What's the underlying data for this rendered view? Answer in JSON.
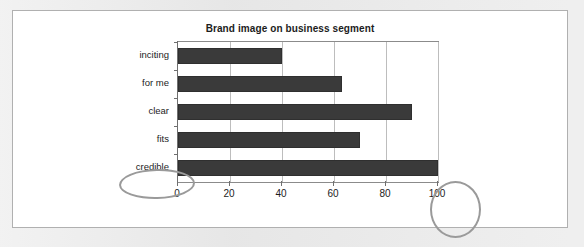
{
  "figure": {
    "title": "Brand image on business segment"
  },
  "chart_data": {
    "type": "bar",
    "orientation": "horizontal",
    "title": "Brand image on business segment",
    "xlabel": "",
    "ylabel": "",
    "categories": [
      "inciting",
      "for me",
      "clear",
      "fits",
      "credible"
    ],
    "values": [
      40,
      63,
      90,
      70,
      100
    ],
    "xlim": [
      0,
      100
    ],
    "xticks": [
      0,
      20,
      40,
      60,
      80,
      100
    ],
    "xtick_labels": [
      "0",
      "20",
      "40",
      "60",
      "80",
      "100"
    ],
    "grid": "vertical",
    "legend": "none",
    "bar_color": "#3a3a3a",
    "series": [
      {
        "name": "Brand image",
        "values": [
          40,
          63,
          90,
          70,
          100
        ]
      }
    ]
  },
  "annotations": [
    {
      "name": "circled-credible",
      "target": "credible",
      "shape": "ellipse",
      "color": "#9a9a9a"
    },
    {
      "name": "circled-100",
      "target": "100",
      "shape": "ellipse",
      "color": "#9a9a9a"
    }
  ]
}
